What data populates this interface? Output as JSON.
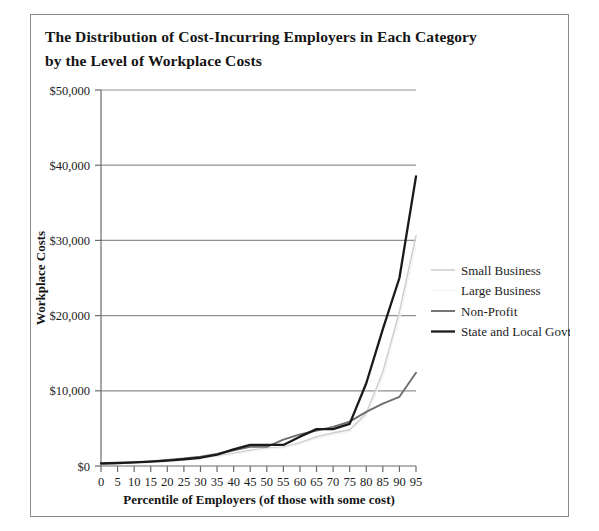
{
  "figure": {
    "title_line1": "The Distribution of Cost-Incurring Employers in Each Category",
    "title_line2": "by the Level of Workplace Costs"
  },
  "chart_data": {
    "type": "line",
    "title": "The Distribution of Cost-Incurring Employers in Each Category by the Level of Workplace Costs",
    "xlabel": "Percentile of Employers (of those with some cost)",
    "ylabel": "Workplace Costs",
    "x": [
      0,
      5,
      10,
      15,
      20,
      25,
      30,
      35,
      40,
      45,
      50,
      55,
      60,
      65,
      70,
      75,
      80,
      85,
      90,
      95
    ],
    "xlim": [
      0,
      95
    ],
    "ylim": [
      0,
      50000
    ],
    "xticks": [
      "0",
      "5",
      "10",
      "15",
      "20",
      "25",
      "30",
      "35",
      "40",
      "45",
      "50",
      "55",
      "60",
      "65",
      "70",
      "75",
      "80",
      "85",
      "90",
      "95"
    ],
    "yticks": [
      "$0",
      "$10,000",
      "$20,000",
      "$30,000",
      "$40,000",
      "$50,000"
    ],
    "ytick_values": [
      0,
      10000,
      20000,
      30000,
      40000,
      50000
    ],
    "grid": "horizontal",
    "legend_position": "right-middle",
    "series": [
      {
        "name": "Small Business",
        "color": "#d0d0d0",
        "width": 1.6,
        "values": [
          300,
          350,
          450,
          550,
          700,
          850,
          1050,
          1300,
          1700,
          2100,
          2400,
          2500,
          3100,
          3900,
          4400,
          4800,
          7000,
          12500,
          20500,
          30600
        ]
      },
      {
        "name": "Large Business",
        "color": "#f4f4f4",
        "width": 1.4,
        "values": [
          250,
          300,
          380,
          470,
          600,
          760,
          950,
          1200,
          1550,
          1950,
          2250,
          2400,
          2900,
          3600,
          4100,
          4600,
          6600,
          11800,
          19600,
          29400
        ]
      },
      {
        "name": "Non-Profit",
        "color": "#6e6e6e",
        "width": 1.9,
        "values": [
          300,
          380,
          480,
          620,
          800,
          1000,
          1250,
          1600,
          2100,
          2550,
          2550,
          3500,
          4200,
          4700,
          5200,
          5900,
          7200,
          8300,
          9200,
          12400
        ]
      },
      {
        "name": "State and Local Govt.",
        "color": "#1a1a1a",
        "width": 2.3,
        "values": [
          350,
          400,
          470,
          580,
          720,
          900,
          1100,
          1500,
          2200,
          2800,
          2800,
          2800,
          3900,
          4900,
          4900,
          5600,
          11000,
          18200,
          25000,
          38500
        ]
      }
    ]
  },
  "legend": {
    "items": [
      {
        "label": "Small Business"
      },
      {
        "label": "Large Business"
      },
      {
        "label": "Non-Profit"
      },
      {
        "label": "State and Local Govt."
      }
    ]
  }
}
